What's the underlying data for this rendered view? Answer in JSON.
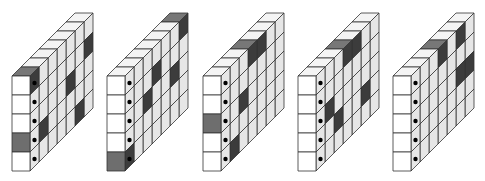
{
  "title_cutoff": "",
  "geometry": {
    "front_top_y": 76,
    "cell_w": 18,
    "cell_h": 19,
    "rows": 5,
    "depth": 7,
    "dx": 9,
    "dy": -9
  },
  "colors": {
    "stroke": "#333333",
    "front": "#ffffff",
    "top": "#f4f4f4",
    "side": "#e6e6e6",
    "dark_front": "#6e6e6e",
    "dark_top": "#777777",
    "dark_side": "#3c3c3c",
    "dot": "#000000"
  },
  "figures": [
    {
      "label": "figure-1",
      "x": 12,
      "front_dark_rows": [
        3
      ],
      "top_dark_cols": [
        0
      ],
      "side_dark": [
        [
          0,
          0
        ],
        [
          1,
          3
        ],
        [
          4,
          2
        ],
        [
          5,
          4
        ],
        [
          6,
          1
        ]
      ]
    },
    {
      "label": "figure-2",
      "x": 107,
      "front_dark_rows": [
        4
      ],
      "top_dark_cols": [
        6
      ],
      "side_dark": [
        [
          0,
          4
        ],
        [
          2,
          2
        ],
        [
          3,
          1
        ],
        [
          5,
          2
        ],
        [
          6,
          0
        ]
      ]
    },
    {
      "label": "figure-3",
      "x": 203,
      "front_dark_rows": [
        2
      ],
      "top_dark_cols": [
        3
      ],
      "side_dark": [
        [
          1,
          4
        ],
        [
          2,
          2
        ],
        [
          3,
          0
        ],
        [
          4,
          0
        ]
      ]
    },
    {
      "label": "figure-4",
      "x": 298,
      "front_dark_rows": [],
      "top_dark_cols": [
        3
      ],
      "side_dark": [
        [
          1,
          2
        ],
        [
          2,
          3
        ],
        [
          3,
          0
        ],
        [
          4,
          0
        ],
        [
          5,
          3
        ]
      ]
    },
    {
      "label": "figure-5",
      "x": 393,
      "front_dark_rows": [],
      "top_dark_cols": [
        3
      ],
      "side_dark": [
        [
          3,
          0
        ],
        [
          5,
          2
        ],
        [
          5,
          0
        ],
        [
          6,
          2
        ]
      ]
    }
  ]
}
